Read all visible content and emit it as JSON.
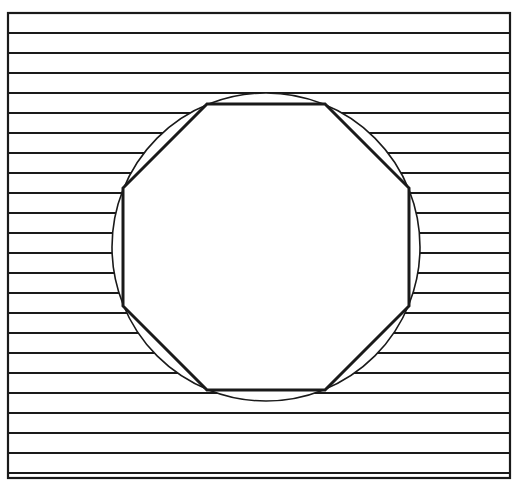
{
  "figure": {
    "canvas": {
      "width": 518,
      "height": 496,
      "background": "#ffffff"
    },
    "stroke_color": "#1a1a1a",
    "fill_color": "#ffffff",
    "frame": {
      "name": "outer-frame",
      "x": 8,
      "y": 13,
      "width": 502,
      "height": 465,
      "stroke_width": 2.2,
      "fill": "none"
    },
    "hatch": {
      "name": "horizontal-hatch-lines",
      "orientation": "horizontal",
      "spacing": 20,
      "stroke_width": 2.0,
      "count": 23,
      "x_start": 9,
      "x_end": 509,
      "y_values": [
        33,
        53,
        73,
        93,
        113,
        133,
        153,
        173,
        193,
        213,
        233,
        253,
        273,
        293,
        313,
        333,
        353,
        373,
        393,
        413,
        433,
        453,
        473
      ]
    },
    "circle": {
      "name": "outer-circle",
      "cx": 266,
      "cy": 247,
      "r": 154,
      "stroke_width": 1.6,
      "fill": "#ffffff"
    },
    "polygon": {
      "name": "inscribed-octagon",
      "sides": 8,
      "stroke_width": 3.0,
      "fill": "#ffffff",
      "points": [
        [
          207,
          104
        ],
        [
          325,
          104
        ],
        [
          409,
          188
        ],
        [
          409,
          306
        ],
        [
          325,
          390
        ],
        [
          207,
          390
        ],
        [
          123,
          306
        ],
        [
          123,
          188
        ]
      ],
      "points_string": "207,104 325,104 409,188 409,306 325,390 207,390 123,306 123,188"
    }
  },
  "chart_data": {
    "type": "diagram",
    "elements": [
      {
        "shape": "rectangle",
        "role": "frame",
        "x": 8,
        "y": 13,
        "width": 502,
        "height": 465
      },
      {
        "shape": "lines",
        "role": "hatching",
        "orientation": "horizontal",
        "spacing_px": 20,
        "count": 23
      },
      {
        "shape": "circle",
        "role": "circumscribed-circle",
        "cx": 266,
        "cy": 247,
        "r": 154
      },
      {
        "shape": "polygon",
        "role": "inscribed-regular-octagon",
        "sides": 8,
        "cx": 266,
        "cy": 247,
        "circumradius": 154,
        "rotation_deg": 22.5
      }
    ],
    "xlabel": "",
    "ylabel": "",
    "legend": []
  }
}
